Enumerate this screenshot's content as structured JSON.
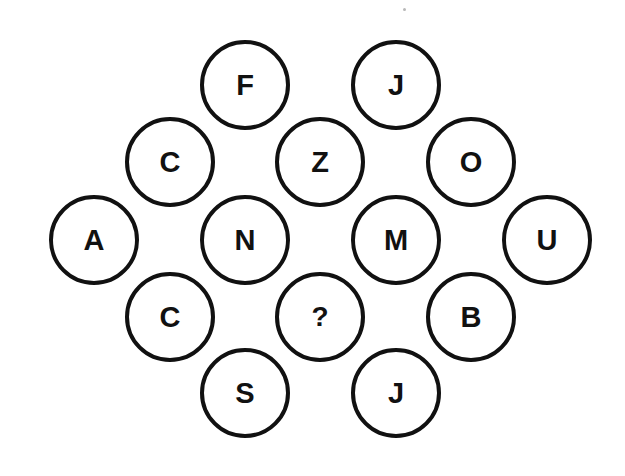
{
  "puzzle": {
    "description": "Letter circles arranged in a diamond lattice with one missing value",
    "circles": [
      {
        "id": "r1c3",
        "letter": "F",
        "cx": 245,
        "cy": 85
      },
      {
        "id": "r1c5",
        "letter": "J",
        "cx": 396,
        "cy": 85
      },
      {
        "id": "r2c2",
        "letter": "C",
        "cx": 170,
        "cy": 162
      },
      {
        "id": "r2c4",
        "letter": "Z",
        "cx": 320,
        "cy": 162
      },
      {
        "id": "r2c6",
        "letter": "O",
        "cx": 471,
        "cy": 162
      },
      {
        "id": "r3c1",
        "letter": "A",
        "cx": 94,
        "cy": 240
      },
      {
        "id": "r3c3",
        "letter": "N",
        "cx": 245,
        "cy": 240
      },
      {
        "id": "r3c5",
        "letter": "M",
        "cx": 396,
        "cy": 240
      },
      {
        "id": "r3c7",
        "letter": "U",
        "cx": 547,
        "cy": 240
      },
      {
        "id": "r4c2",
        "letter": "C",
        "cx": 170,
        "cy": 317
      },
      {
        "id": "r4c4",
        "letter": "?",
        "cx": 320,
        "cy": 317
      },
      {
        "id": "r4c6",
        "letter": "B",
        "cx": 471,
        "cy": 317
      },
      {
        "id": "r5c3",
        "letter": "S",
        "cx": 245,
        "cy": 393
      },
      {
        "id": "r5c5",
        "letter": "J",
        "cx": 396,
        "cy": 393
      }
    ],
    "unknown_symbol": "?",
    "colors": {
      "stroke": "#111111",
      "text": "#111111",
      "background": "#ffffff"
    }
  }
}
